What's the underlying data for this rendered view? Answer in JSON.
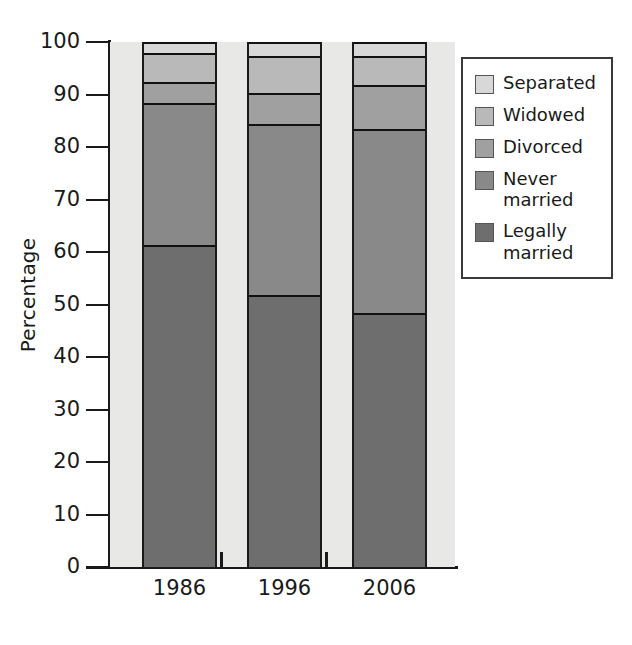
{
  "chart_data": {
    "type": "bar",
    "subtype": "stacked-bar-percentage",
    "title": "",
    "xlabel": "",
    "ylabel": "Percentage",
    "categories": [
      "1986",
      "1996",
      "2006"
    ],
    "ylim": [
      0,
      100
    ],
    "yticks": [
      0,
      10,
      20,
      30,
      40,
      50,
      60,
      70,
      80,
      90,
      100
    ],
    "ytick_labels": [
      "0",
      "10",
      "20",
      "30",
      "40",
      "50",
      "60",
      "70",
      "80",
      "90",
      "100"
    ],
    "grid": "horizontal-dashed",
    "legend_position": "right-top",
    "stack_order_bottom_to_top": [
      "Legally married",
      "Never married",
      "Divorced",
      "Widowed",
      "Separated"
    ],
    "series": [
      {
        "name": "Legally married",
        "color": "#6e6e6e",
        "values": [
          61.0,
          51.5,
          48.0
        ]
      },
      {
        "name": "Never married",
        "color": "#898989",
        "values": [
          27.0,
          32.5,
          35.0
        ]
      },
      {
        "name": "Divorced",
        "color": "#a0a0a0",
        "values": [
          4.0,
          6.0,
          8.5
        ]
      },
      {
        "name": "Widowed",
        "color": "#b9b9b9",
        "values": [
          5.5,
          7.0,
          5.5
        ]
      },
      {
        "name": "Separated",
        "color": "#d8d8d8",
        "values": [
          2.5,
          3.0,
          3.0
        ]
      }
    ],
    "cumulative_tops": {
      "1986": {
        "Legally married": 61.0,
        "Never married": 88.0,
        "Divorced": 92.0,
        "Widowed": 97.5,
        "Separated": 100.0
      },
      "1996": {
        "Legally married": 51.5,
        "Never married": 84.0,
        "Divorced": 90.0,
        "Widowed": 97.0,
        "Separated": 100.0
      },
      "2006": {
        "Legally married": 48.0,
        "Never married": 83.0,
        "Divorced": 91.5,
        "Widowed": 97.0,
        "Separated": 100.0
      }
    }
  },
  "legend": {
    "items": [
      {
        "label": "Separated",
        "color": "#d8d8d8"
      },
      {
        "label": "Widowed",
        "color": "#b9b9b9"
      },
      {
        "label": "Divorced",
        "color": "#a0a0a0"
      },
      {
        "label": "Never\nmarried",
        "color": "#898989"
      },
      {
        "label": "Legally\nmarried",
        "color": "#6e6e6e"
      }
    ]
  },
  "axes": {
    "y_title": "Percentage",
    "y_ticks": [
      "100",
      "90",
      "80",
      "70",
      "60",
      "50",
      "40",
      "30",
      "20",
      "10",
      "0"
    ],
    "x_ticks": [
      "1986",
      "1996",
      "2006"
    ]
  },
  "colors": {
    "plot_background": "#e8e8e6",
    "axis": "#1a1a1a",
    "gridline": "#5a5a5a",
    "segment_border": "#111111",
    "legend_border": "#3a3a3a"
  }
}
